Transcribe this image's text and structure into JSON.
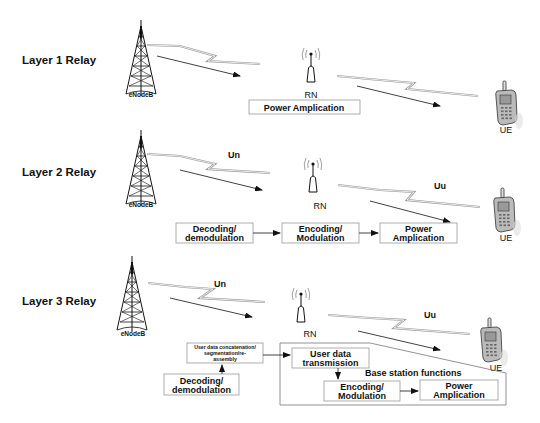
{
  "rows": [
    {
      "label": "Layer 1 Relay",
      "enodeb": "eNodeB",
      "rn": "RN",
      "ue": "UE",
      "boxes": [
        "Power Amplication"
      ]
    },
    {
      "label": "Layer 2 Relay",
      "enodeb": "eNodeB",
      "rn": "RN",
      "ue": "UE",
      "un": "Un",
      "uu": "Uu",
      "boxes": [
        {
          "l1": "Decoding/",
          "l2": "demodulation"
        },
        {
          "l1": "Encoding/",
          "l2": "Modulation"
        },
        {
          "l1": "Power",
          "l2": "Amplication"
        }
      ]
    },
    {
      "label": "Layer 3 Relay",
      "enodeb": "eNodeB",
      "rn": "RN",
      "ue": "UE",
      "un": "Un",
      "uu": "Uu",
      "concat": {
        "l1": "User data concatenation/",
        "l2": "segmentation/re-",
        "l3": "assembly"
      },
      "decoding": {
        "l1": "Decoding/",
        "l2": "demodulation"
      },
      "user_tx": {
        "l1": "User data",
        "l2": "transmission"
      },
      "group_label": "Base station functions",
      "encoding": {
        "l1": "Encoding/",
        "l2": "Modulation"
      },
      "power": {
        "l1": "Power",
        "l2": "Amplication"
      }
    }
  ]
}
